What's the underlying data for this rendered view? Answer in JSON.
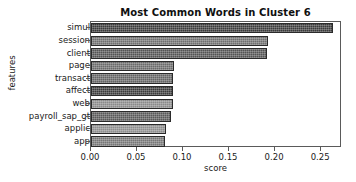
{
  "chart_data": {
    "type": "bar",
    "orientation": "horizontal",
    "title": "Most Common Words in Cluster 6",
    "xlabel": "score",
    "ylabel": "features",
    "categories": [
      "simul",
      "session",
      "client",
      "page",
      "transact",
      "affect",
      "web",
      "payroll_sap_gt",
      "applic",
      "app"
    ],
    "values": [
      0.263,
      0.192,
      0.191,
      0.09,
      0.089,
      0.089,
      0.089,
      0.087,
      0.081,
      0.08
    ],
    "bar_colors": [
      "#3a3a3a",
      "#6f6f6f",
      "#545454",
      "#6a6a6a",
      "#646464",
      "#3c3c3c",
      "#8a8a8a",
      "#595959",
      "#8e8e8e",
      "#767676"
    ],
    "xlim": [
      0.0,
      0.2727
    ],
    "xticks": [
      0.0,
      0.05,
      0.1,
      0.15,
      0.2,
      0.25
    ],
    "xtick_labels": [
      "0.00",
      "0.05",
      "0.10",
      "0.15",
      "0.20",
      "0.25"
    ],
    "grid": false,
    "legend": null,
    "frame_color": "#5a5a5a",
    "background": "#ffffff"
  }
}
